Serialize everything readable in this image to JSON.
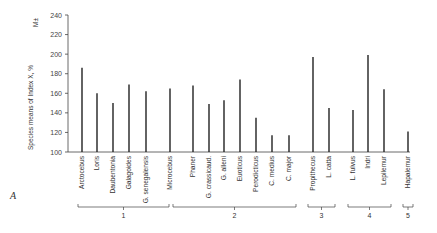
{
  "chart_data": {
    "type": "bar",
    "title": "",
    "panel_label": "A",
    "ylabel": "Species means of Index X, %",
    "ylabel_extra": "M±",
    "xlabel": "",
    "ylim": [
      100,
      240
    ],
    "yticks": [
      100,
      120,
      140,
      160,
      180,
      200,
      220,
      240
    ],
    "grid": false,
    "categories": [
      "Arctocebus",
      "Loris",
      "Daubentonia",
      "Galagoides",
      "G. senegalensis",
      "Microcebus",
      "Phaner",
      "G. crassicaud.",
      "G. alleni",
      "Euoticus",
      "Perodicticus",
      "C. medius",
      "C. major",
      "Propithecus",
      "L. catta",
      "L. fulvus",
      "Indri",
      "Lepilemur",
      "Hapalemur"
    ],
    "values": [
      186,
      160,
      150,
      169,
      162,
      165,
      168,
      149,
      153,
      174,
      135,
      117,
      117,
      197,
      145,
      143,
      199,
      164,
      121
    ],
    "groups": [
      {
        "label": "1",
        "members": [
          "Arctocebus",
          "Loris",
          "Daubentonia",
          "Galagoides",
          "G. senegalensis",
          "Microcebus"
        ]
      },
      {
        "label": "2",
        "members": [
          "Phaner",
          "G. crassicaud.",
          "G. alleni",
          "Euoticus",
          "Perodicticus",
          "C. medius",
          "C. major"
        ]
      },
      {
        "label": "3",
        "members": [
          "Propithecus",
          "L. catta"
        ]
      },
      {
        "label": "4",
        "members": [
          "L. fulvus",
          "Indri",
          "Lepilemur"
        ]
      },
      {
        "label": "5",
        "members": [
          "Hapalemur"
        ]
      }
    ]
  },
  "layout": {
    "bar_x": [
      82,
      97,
      113,
      129,
      146,
      170,
      193,
      209,
      224,
      240,
      256,
      272,
      289,
      313,
      329,
      353,
      368,
      384,
      408
    ],
    "group_spans": [
      [
        78,
        169
      ],
      [
        173,
        296
      ],
      [
        308,
        335
      ],
      [
        348,
        391
      ],
      [
        403,
        413
      ]
    ]
  },
  "colors": {
    "bar": "#222222",
    "axis": "#444444"
  }
}
